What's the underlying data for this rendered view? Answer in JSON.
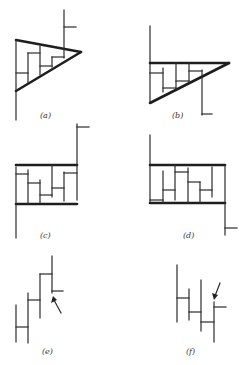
{
  "figure": {
    "panels": [
      {
        "id": "a",
        "label": "(a)",
        "pattern": "symmetrical/descending triangle with upside breakout"
      },
      {
        "id": "b",
        "label": "(b)",
        "pattern": "descending triangle with downside breakout"
      },
      {
        "id": "c",
        "label": "(c)",
        "pattern": "rectangle with upside breakout"
      },
      {
        "id": "d",
        "label": "(d)",
        "pattern": "rectangle with downside breakout"
      },
      {
        "id": "e",
        "label": "(e)",
        "pattern": "stepping up bars with arrow marker"
      },
      {
        "id": "f",
        "label": "(f)",
        "pattern": "stepping down bars with arrow marker"
      }
    ]
  }
}
